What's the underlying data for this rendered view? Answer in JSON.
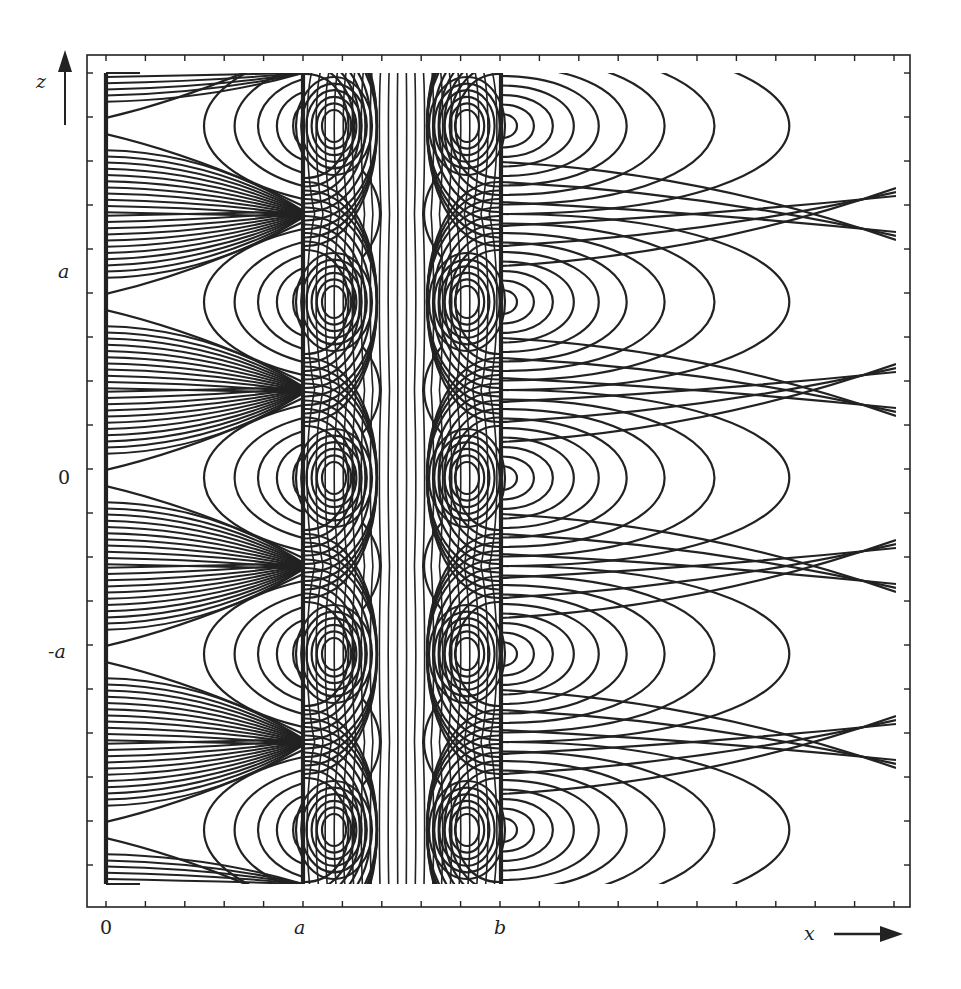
{
  "figure": {
    "line_color": "#222222",
    "background": "#ffffff"
  },
  "axes": {
    "x_label": "x",
    "z_label": "z",
    "x_ticks": [
      {
        "label": "0",
        "px": 106
      },
      {
        "label": "a",
        "px": 300
      },
      {
        "label": "b",
        "px": 500
      }
    ],
    "z_ticks": [
      {
        "label": "a",
        "py": 302
      },
      {
        "label": "0",
        "py": 478
      },
      {
        "label": "-a",
        "py": 654
      }
    ],
    "frame": {
      "left": 87,
      "top": 55,
      "right": 910,
      "bottom": 907
    },
    "minor_tick_spacing_px": 39.4
  },
  "plates": [
    {
      "name": "plate-x0",
      "x": 106,
      "z_top": 73,
      "z_bottom": 884
    },
    {
      "name": "plate-xa",
      "x": 303,
      "z_top": 73,
      "z_bottom": 884
    },
    {
      "name": "plate-xb",
      "x": 501,
      "z_top": 73,
      "z_bottom": 884
    }
  ],
  "vortices": {
    "x_centers": [
      334,
      467
    ],
    "z_centers": [
      126,
      302,
      478,
      654,
      830
    ],
    "period_px": 176
  },
  "contours": {
    "inner_loops_per_vortex": 6,
    "central_vertical_lines": 22,
    "right_arcs_apex_x": [
      517,
      534,
      553,
      574,
      599,
      627,
      665,
      715,
      790
    ],
    "left_arcs_apex_x": [
      193,
      227,
      253,
      274,
      292
    ],
    "left_fan_lines_per_period": 11
  }
}
